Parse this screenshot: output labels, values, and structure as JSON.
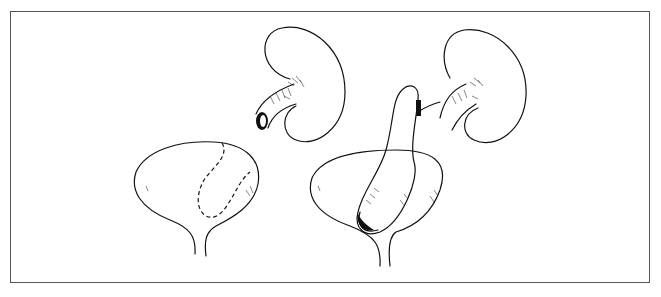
{
  "figure": {
    "type": "line-illustration",
    "panels": [
      {
        "id": "left",
        "elements": [
          "kidney-with-cut-ureter",
          "bladder-with-dashed-flap-outline"
        ]
      },
      {
        "id": "right",
        "elements": [
          "kidney-with-ureter",
          "bladder-with-tubular-flap-anastomosis"
        ]
      }
    ],
    "colors": {
      "line": "#111111",
      "frame": "#555555",
      "background": "#ffffff"
    }
  }
}
